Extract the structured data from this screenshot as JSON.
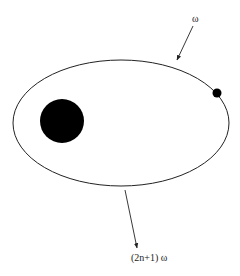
{
  "diagram": {
    "type": "orbit",
    "colors": {
      "stroke": "#222222",
      "fill": "#000000",
      "background": "#ffffff"
    },
    "orbit": {
      "shape": "ellipse",
      "cx": 121,
      "cy": 123,
      "rx": 108,
      "ry": 63
    },
    "central_body": {
      "cx": 62,
      "cy": 121,
      "r": 22
    },
    "orbiting_body": {
      "cx": 217,
      "cy": 93,
      "r": 4.5
    },
    "incoming_arrow": {
      "label": "ω",
      "from": [
        193,
        26
      ],
      "to": [
        177,
        60
      ]
    },
    "outgoing_arrow": {
      "label": "(2n+1) ω",
      "from": [
        125,
        190
      ],
      "to": [
        137,
        248
      ]
    }
  }
}
